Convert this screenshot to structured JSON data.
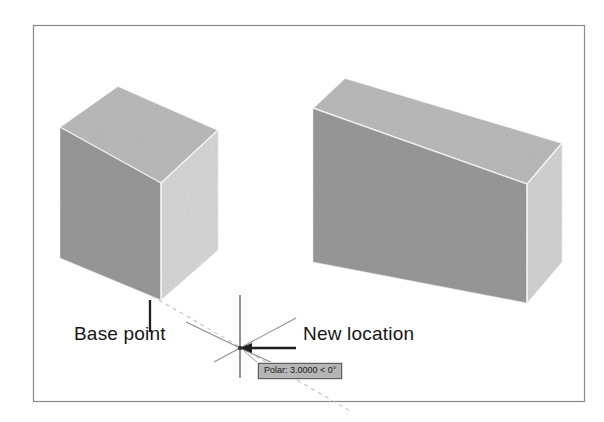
{
  "figure": {
    "kind": "cad-move-illustration",
    "frame": {
      "border_color": "#8a8a8a",
      "x": 33,
      "y": 25,
      "width": 552,
      "height": 377
    },
    "background_color": "#ffffff"
  },
  "annotations": {
    "base_point_label": "Base point",
    "new_location_label": "New location"
  },
  "tooltip": {
    "text": "Polar: 3.0000 < 0°",
    "background_color": "#b6b6b6",
    "border_color": "#5d5d5d",
    "text_color": "#1a1a1a"
  },
  "shapes": {
    "source_box": {
      "name": "original-box",
      "front_face_color": "#9a9a9a",
      "side_face_color": "#d8d8d8",
      "top_face_color": "#bcbcbc",
      "edge_color": "#ffffff"
    },
    "destination_box": {
      "name": "moved-box",
      "front_face_color": "#9a9a9a",
      "side_face_color": "#d4d4d4",
      "top_face_color": "#bcbcbc",
      "edge_color": "#ffffff"
    }
  },
  "cursor": {
    "name": "crosshair-cursor",
    "crosshair_color": "#3a3a3a",
    "polar_ray_color": "#8d8d8d",
    "center_x": 240,
    "center_y": 348
  },
  "leaders": {
    "base_point_leader_color": "#1f1f1f",
    "new_location_arrow_color": "#1f1f1f",
    "tracking_line_color": "#b9b9b9",
    "tracking_line_style": "dashed"
  }
}
